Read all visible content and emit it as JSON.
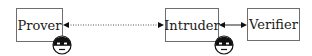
{
  "diagram": {
    "nodes": [
      {
        "id": "prover",
        "label": "Prover"
      },
      {
        "id": "intruder",
        "label": "Intruder"
      },
      {
        "id": "verifier",
        "label": "Verifier"
      }
    ],
    "edges": [
      {
        "from": "prover",
        "to": "intruder",
        "style": "dotted",
        "direction": "bidirectional"
      },
      {
        "from": "intruder",
        "to": "verifier",
        "style": "solid",
        "direction": "bidirectional"
      }
    ],
    "icons": [
      {
        "name": "masked-face-icon",
        "attached_to": "prover"
      },
      {
        "name": "masked-face-icon",
        "attached_to": "intruder"
      }
    ]
  }
}
